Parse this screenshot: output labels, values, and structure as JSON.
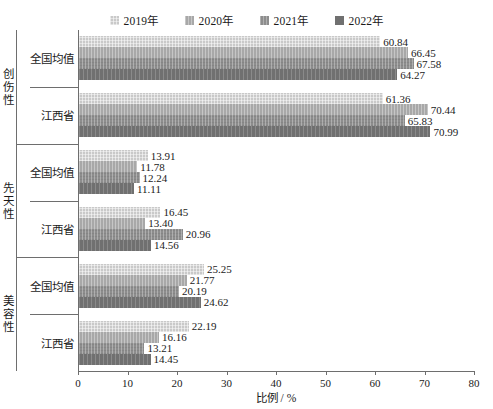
{
  "chart_data": {
    "type": "bar",
    "orientation": "horizontal",
    "title": "",
    "xlabel": "比例 / %",
    "ylabel": "",
    "xlim": [
      0,
      80
    ],
    "xticks": [
      0,
      10,
      20,
      30,
      40,
      50,
      60,
      70,
      80
    ],
    "grid": false,
    "legend_position": "top-center",
    "series": [
      {
        "name": "2019年",
        "color": "#c9c9c9"
      },
      {
        "name": "2020年",
        "color": "#a8a8a8"
      },
      {
        "name": "2021年",
        "color": "#8d8d8d"
      },
      {
        "name": "2022年",
        "color": "#707070"
      }
    ],
    "groups": [
      {
        "name": "创伤性",
        "categories": [
          {
            "name": "全国均值",
            "values": [
              60.84,
              66.45,
              67.58,
              64.27
            ]
          },
          {
            "name": "江西省",
            "values": [
              61.36,
              70.44,
              65.83,
              70.99
            ]
          }
        ]
      },
      {
        "name": "先天性",
        "categories": [
          {
            "name": "全国均值",
            "values": [
              13.91,
              11.78,
              12.24,
              11.11
            ]
          },
          {
            "name": "江西省",
            "values": [
              16.45,
              13.4,
              20.96,
              14.56
            ]
          }
        ]
      },
      {
        "name": "美容性",
        "categories": [
          {
            "name": "全国均值",
            "values": [
              25.25,
              21.77,
              20.19,
              24.62
            ]
          },
          {
            "name": "江西省",
            "values": [
              22.19,
              16.16,
              13.21,
              14.45
            ]
          }
        ]
      }
    ],
    "value_labels": [
      [
        "60.84",
        "66.45",
        "67.58",
        "64.27"
      ],
      [
        "61.36",
        "70.44",
        "65.83",
        "70.99"
      ],
      [
        "13.91",
        "11.78",
        "12.24",
        "11.11"
      ],
      [
        "16.45",
        "13.40",
        "20.96",
        "14.56"
      ],
      [
        "25.25",
        "21.77",
        "20.19",
        "24.62"
      ],
      [
        "22.19",
        "16.16",
        "13.21",
        "14.45"
      ]
    ]
  },
  "legend": {
    "items": [
      {
        "label": "2019年"
      },
      {
        "label": "2020年"
      },
      {
        "label": "2021年"
      },
      {
        "label": "2022年"
      }
    ]
  },
  "axis": {
    "x_title": "比例 / %",
    "x_tick_labels": [
      "0",
      "10",
      "20",
      "30",
      "40",
      "50",
      "60",
      "70",
      "80"
    ]
  }
}
